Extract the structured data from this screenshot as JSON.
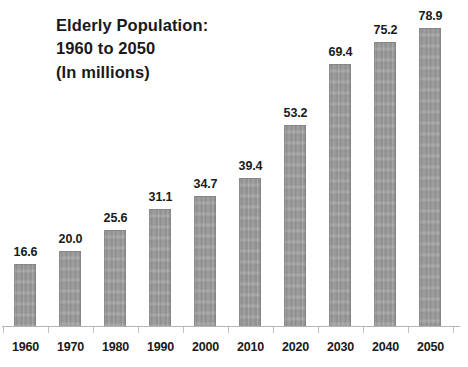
{
  "chart_data": {
    "type": "bar",
    "title": "Elderly Population: 1960 to 2050 (In millions)",
    "title_lines": [
      "Elderly Population:",
      "1960 to 2050",
      "(In millions)"
    ],
    "xlabel": "",
    "ylabel": "",
    "ylim": [
      0,
      78.9
    ],
    "grid": false,
    "legend": "none",
    "units": "millions",
    "bar_color": "#9d9d9d",
    "text_color": "#1a1a1a",
    "axis_color": "#b4b4b4",
    "background_color": "#ffffff",
    "categories": [
      "1960",
      "1970",
      "1980",
      "1990",
      "2000",
      "2010",
      "2020",
      "2030",
      "2040",
      "2050"
    ],
    "values": [
      16.6,
      20.0,
      25.6,
      31.1,
      34.7,
      39.4,
      53.2,
      69.4,
      75.2,
      78.9
    ],
    "value_labels": [
      "16.6",
      "20.0",
      "25.6",
      "31.1",
      "34.7",
      "39.4",
      "53.2",
      "69.4",
      "75.2",
      "78.9"
    ]
  }
}
